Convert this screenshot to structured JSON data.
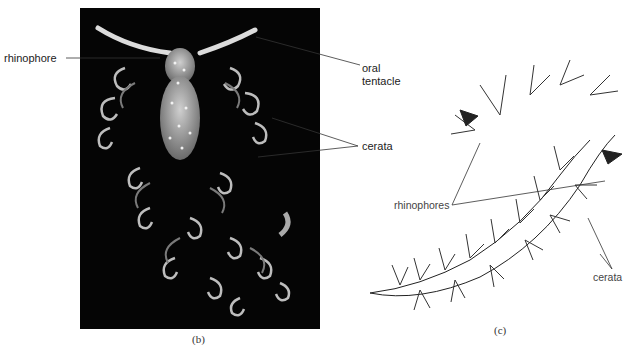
{
  "figure": {
    "panel_b": {
      "caption": "(b)",
      "labels": {
        "rhinophore": "rhinophore",
        "oral_tentacle_line1": "oral",
        "oral_tentacle_line2": "tentacle",
        "cerata": "cerata"
      }
    },
    "panel_c": {
      "caption": "(c)",
      "labels": {
        "rhinophores": "rhinophores",
        "cerata": "cerata"
      }
    }
  }
}
